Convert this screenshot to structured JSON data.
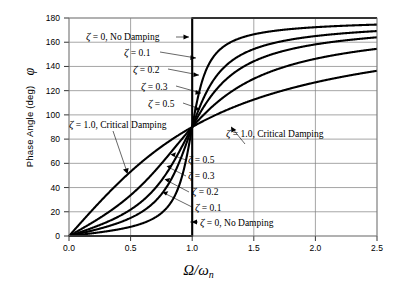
{
  "chart_data": {
    "type": "line",
    "title": "",
    "xlabel": "Ω/ωn",
    "ylabel": "Phase Angle (deg)  φ",
    "xlim": [
      0.0,
      2.5
    ],
    "ylim": [
      0,
      180
    ],
    "xticks": [
      "0.0",
      "0.5",
      "1.0",
      "1.5",
      "2.0",
      "2.5"
    ],
    "yticks": [
      "0",
      "20",
      "40",
      "60",
      "80",
      "100",
      "120",
      "140",
      "160",
      "180"
    ],
    "grid": true,
    "legend_position": "inline-annotations",
    "series": [
      {
        "name": "ζ = 0, No Damping",
        "zeta": 0.0,
        "x": [
          0.0,
          0.2,
          0.4,
          0.6,
          0.8,
          0.95,
          0.999,
          1.0,
          1.001,
          1.05,
          1.2,
          1.5,
          2.0,
          2.5
        ],
        "y": [
          0,
          0,
          0,
          0,
          0,
          0,
          0,
          90,
          180,
          180,
          180,
          180,
          180,
          180
        ]
      },
      {
        "name": "ζ = 0.1",
        "zeta": 0.1,
        "x": [
          0.0,
          0.1,
          0.2,
          0.3,
          0.4,
          0.5,
          0.6,
          0.7,
          0.8,
          0.9,
          0.95,
          1.0,
          1.05,
          1.1,
          1.2,
          1.3,
          1.5,
          1.75,
          2.0,
          2.25,
          2.5
        ],
        "y": [
          0,
          1.2,
          2.4,
          3.8,
          5.4,
          7.6,
          10.6,
          15.5,
          24.0,
          43.5,
          62.7,
          90,
          117.3,
          136.5,
          156.0,
          164.5,
          171.0,
          174.1,
          175.8,
          176.8,
          177.5
        ]
      },
      {
        "name": "ζ = 0.2",
        "zeta": 0.2,
        "x": [
          0.0,
          0.1,
          0.2,
          0.3,
          0.4,
          0.5,
          0.6,
          0.7,
          0.8,
          0.9,
          0.95,
          1.0,
          1.05,
          1.1,
          1.2,
          1.3,
          1.5,
          1.75,
          2.0,
          2.25,
          2.5
        ],
        "y": [
          0,
          2.3,
          4.8,
          7.5,
          10.8,
          15.0,
          20.6,
          28.8,
          41.6,
          61.6,
          72.9,
          90,
          107.1,
          120.4,
          138.0,
          147.8,
          157.4,
          163.3,
          166.6,
          168.6,
          170.0
        ]
      },
      {
        "name": "ζ = 0.3",
        "zeta": 0.3,
        "x": [
          0.0,
          0.1,
          0.2,
          0.3,
          0.4,
          0.5,
          0.6,
          0.7,
          0.8,
          0.9,
          0.95,
          1.0,
          1.05,
          1.1,
          1.2,
          1.3,
          1.5,
          1.75,
          2.0,
          2.25,
          2.5
        ],
        "y": [
          0,
          3.5,
          7.1,
          11.2,
          16.0,
          21.8,
          29.4,
          39.6,
          53.1,
          69.6,
          77.8,
          90,
          101.6,
          111.4,
          127.1,
          137.0,
          149.0,
          156.3,
          160.5,
          163.2,
          165.0
        ]
      },
      {
        "name": "ζ = 0.5",
        "zeta": 0.5,
        "x": [
          0.0,
          0.1,
          0.2,
          0.3,
          0.4,
          0.5,
          0.6,
          0.7,
          0.8,
          0.9,
          0.95,
          1.0,
          1.05,
          1.1,
          1.2,
          1.3,
          1.5,
          1.75,
          2.0,
          2.25,
          2.5
        ],
        "y": [
          0,
          5.8,
          11.8,
          18.2,
          25.4,
          33.7,
          43.2,
          54.0,
          65.8,
          78.0,
          84.0,
          90,
          95.6,
          100.8,
          110.0,
          117.6,
          129.2,
          138.4,
          146.3,
          150.6,
          154.4
        ]
      },
      {
        "name": "ζ = 1.0, Critical Damping",
        "zeta": 1.0,
        "x": [
          0.0,
          0.1,
          0.2,
          0.3,
          0.4,
          0.5,
          0.6,
          0.7,
          0.8,
          0.9,
          0.95,
          1.0,
          1.05,
          1.1,
          1.2,
          1.3,
          1.5,
          1.75,
          2.0,
          2.25,
          2.5
        ],
        "y": [
          0,
          11.4,
          23.6,
          33.4,
          43.6,
          53.1,
          61.9,
          69.0,
          74.8,
          83.5,
          87.0,
          90,
          93.0,
          95.8,
          101.2,
          106.0,
          112.6,
          121.0,
          126.9,
          131.0,
          134.0
        ]
      }
    ],
    "annotations": [
      {
        "id": "ann-upper-zeta0",
        "text": "ζ = 0,  No Damping",
        "zeta_symbol": "ζ",
        "rest": " = 0,  No Damping"
      },
      {
        "id": "ann-upper-zeta01",
        "text": "ζ = 0.1",
        "zeta_symbol": "ζ",
        "rest": " = 0.1"
      },
      {
        "id": "ann-upper-zeta02",
        "text": "ζ = 0.2",
        "zeta_symbol": "ζ",
        "rest": " = 0.2"
      },
      {
        "id": "ann-upper-zeta03",
        "text": "ζ = 0.3",
        "zeta_symbol": "ζ",
        "rest": " = 0.3"
      },
      {
        "id": "ann-upper-zeta05",
        "text": "ζ = 0.5",
        "zeta_symbol": "ζ",
        "rest": " = 0.5"
      },
      {
        "id": "ann-left-zeta10",
        "text": "ζ = 1.0, Critical Damping",
        "zeta_symbol": "ζ",
        "rest": " = 1.0, Critical Damping"
      },
      {
        "id": "ann-right-zeta10",
        "text": "ζ = 1.0, Critical Damping",
        "zeta_symbol": "ζ",
        "rest": " = 1.0, Critical Damping"
      },
      {
        "id": "ann-lower-zeta05",
        "text": "ζ = 0.5",
        "zeta_symbol": "ζ",
        "rest": " = 0.5"
      },
      {
        "id": "ann-lower-zeta03",
        "text": "ζ = 0.3",
        "zeta_symbol": "ζ",
        "rest": " = 0.3"
      },
      {
        "id": "ann-lower-zeta02",
        "text": "ζ = 0.2",
        "zeta_symbol": "ζ",
        "rest": " = 0.2"
      },
      {
        "id": "ann-lower-zeta01",
        "text": "ζ = 0.1",
        "zeta_symbol": "ζ",
        "rest": " = 0.1"
      },
      {
        "id": "ann-lower-zeta0",
        "text": "ζ = 0,  No Damping",
        "zeta_symbol": "ζ",
        "rest": " = 0,  No Damping"
      }
    ],
    "colors": {
      "curve": "#000000",
      "grid": "#808080",
      "axis": "#000000",
      "background": "#ffffff"
    }
  },
  "axes": {
    "y_title_main": "Phase Angle (deg)",
    "y_title_symbol": "φ",
    "x_title_main": "Ω/ω",
    "x_title_sub": "n"
  },
  "yticks": {
    "t0": "0",
    "t20": "20",
    "t40": "40",
    "t60": "60",
    "t80": "80",
    "t100": "100",
    "t120": "120",
    "t140": "140",
    "t160": "160",
    "t180": "180"
  },
  "xticks": {
    "t00": "0.0",
    "t05": "0.5",
    "t10": "1.0",
    "t15": "1.5",
    "t20": "2.0",
    "t25": "2.5"
  },
  "notes": {
    "zeta": "ζ",
    "n0": " = 0,  No Damping",
    "n01": " = 0.1",
    "n02": " = 0.2",
    "n03": " = 0.3",
    "n05": " = 0.5",
    "n10": " = 1.0, Critical Damping"
  }
}
